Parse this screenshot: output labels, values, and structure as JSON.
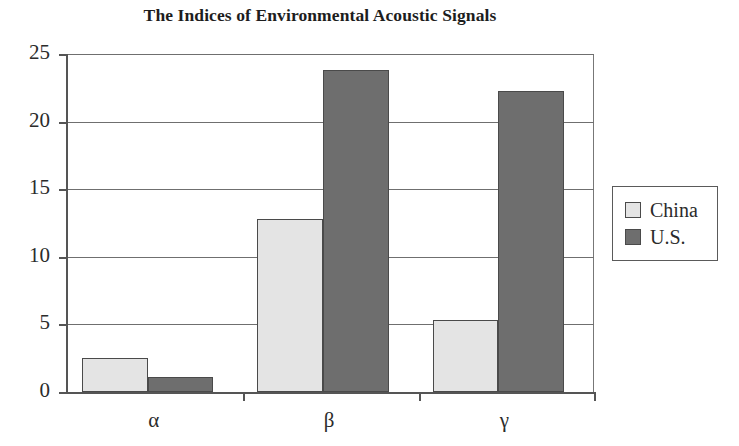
{
  "chart_data": {
    "type": "bar",
    "title": "The Indices of Environmental Acoustic Signals",
    "xlabel": "",
    "ylabel": "",
    "categories": [
      "α",
      "β",
      "γ"
    ],
    "series": [
      {
        "name": "China",
        "values": [
          2.5,
          12.8,
          5.3
        ],
        "color": "#e4e4e4"
      },
      {
        "name": "U.S.",
        "values": [
          1.1,
          23.8,
          22.3
        ],
        "color": "#6e6e6e"
      }
    ],
    "ylim": [
      0,
      25
    ],
    "yticks": [
      0,
      5,
      10,
      15,
      20,
      25
    ],
    "ytick_labels": [
      "0",
      "5",
      "10",
      "15",
      "20",
      "25"
    ],
    "grid": true,
    "grid_axis": "y",
    "legend_position": "right",
    "legend_entries": [
      "China",
      "U.S."
    ],
    "bar_edge_color": "#4a4a4a",
    "axis_color": "#555555",
    "gridline_color": "#6f6f6f",
    "background": "#ffffff"
  }
}
